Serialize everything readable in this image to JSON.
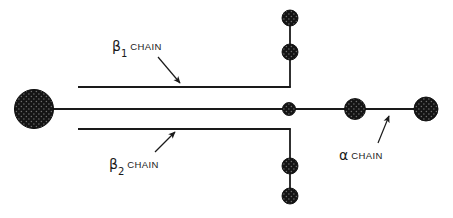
{
  "figure": {
    "background_color": "#ffffff",
    "stroke_color": "#1a1a1a",
    "node_fill_color": "#1a1a1a",
    "width": 453,
    "height": 218
  },
  "labels": {
    "beta1": {
      "greek": "β",
      "subscript": "1",
      "word": "CHAIN",
      "full_text": "β1 CHAIN"
    },
    "beta2": {
      "greek": "β",
      "subscript": "2",
      "word": "CHAIN",
      "full_text": "β2 CHAIN"
    },
    "alpha": {
      "greek": "α",
      "subscript": "",
      "word": "CHAIN",
      "full_text": "α CHAIN"
    }
  },
  "nodes": [
    {
      "name": "left-terminal-node",
      "cx": 34,
      "cy": 109,
      "r": 19.5
    },
    {
      "name": "center-junction-node",
      "cx": 289,
      "cy": 109,
      "r": 6.5
    },
    {
      "name": "alpha-mid-node",
      "cx": 355,
      "cy": 109,
      "r": 10.5
    },
    {
      "name": "alpha-terminal-node",
      "cx": 426,
      "cy": 109,
      "r": 12.0
    },
    {
      "name": "beta1-outer-node",
      "cx": 290,
      "cy": 18,
      "r": 8.0
    },
    {
      "name": "beta1-inner-node",
      "cx": 290,
      "cy": 52,
      "r": 8.0
    },
    {
      "name": "beta2-inner-node",
      "cx": 290,
      "cy": 166,
      "r": 8.0
    },
    {
      "name": "beta2-outer-node",
      "cx": 290,
      "cy": 196,
      "r": 8.0
    }
  ],
  "edges": [
    {
      "name": "main-axis-line",
      "x1": 34,
      "y1": 109,
      "x2": 426,
      "y2": 109
    },
    {
      "name": "beta1-horizontal-line",
      "x1": 78,
      "y1": 87,
      "x2": 290,
      "y2": 87
    },
    {
      "name": "beta1-vertical-line",
      "x1": 290,
      "y1": 87,
      "x2": 290,
      "y2": 10
    },
    {
      "name": "beta2-horizontal-line",
      "x1": 78,
      "y1": 129,
      "x2": 290,
      "y2": 129
    },
    {
      "name": "beta2-vertical-line",
      "x1": 290,
      "y1": 129,
      "x2": 290,
      "y2": 204
    }
  ],
  "pointers": [
    {
      "name": "beta1-pointer",
      "x1": 158,
      "y1": 57,
      "x2": 180,
      "y2": 83
    },
    {
      "name": "beta2-pointer",
      "x1": 155,
      "y1": 152,
      "x2": 175,
      "y2": 132
    },
    {
      "name": "alpha-pointer",
      "x1": 378,
      "y1": 143,
      "x2": 389,
      "y2": 116
    }
  ]
}
